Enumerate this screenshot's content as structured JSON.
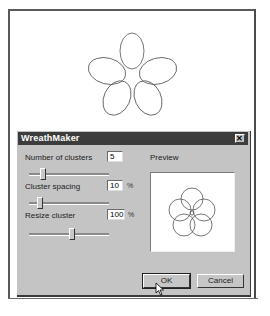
{
  "dialog": {
    "title": "WreathMaker",
    "close_label": "✕",
    "controls": [
      {
        "label": "Number of clusters",
        "mnemonic": "N",
        "value": "5",
        "unit": ""
      },
      {
        "label": "Cluster spacing",
        "mnemonic": "C",
        "value": "10",
        "unit": "%"
      },
      {
        "label": "Resize cluster",
        "mnemonic": "R",
        "value": "100",
        "unit": "%"
      }
    ],
    "preview_label": "Preview",
    "ok_label": "OK",
    "cancel_label": "Cancel"
  },
  "colors": {
    "titlebar": "#3c3c3c",
    "dialog_face": "#c4c4c4",
    "stroke": "#555555"
  }
}
